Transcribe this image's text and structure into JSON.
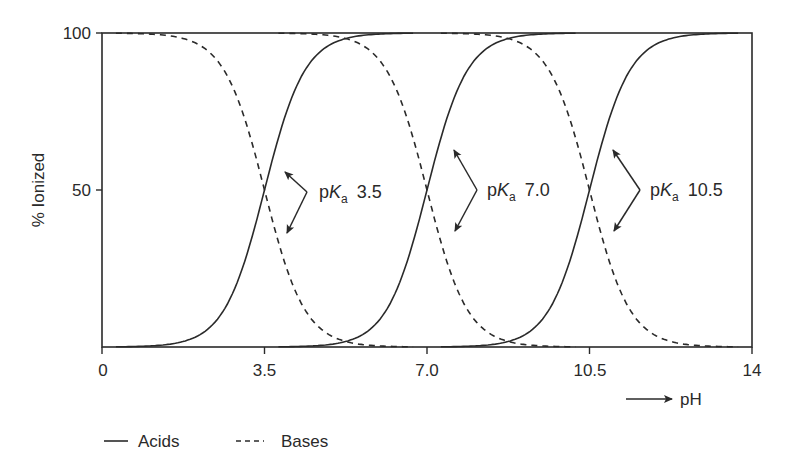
{
  "chart_data": {
    "type": "line",
    "title": "",
    "xlabel": "pH",
    "ylabel": "% Ionized",
    "xlim": [
      0,
      14
    ],
    "ylim": [
      0,
      100
    ],
    "grid": false,
    "legend_position": "bottom-left",
    "x_ticks": [
      "0",
      "3.5",
      "7.0",
      "10.5",
      "14"
    ],
    "x_tick_values": [
      0,
      3.5,
      7.0,
      10.5,
      14
    ],
    "y_ticks": [
      "50",
      "100"
    ],
    "y_tick_values": [
      50,
      100
    ],
    "legend": [
      {
        "name": "Acids",
        "style": "solid"
      },
      {
        "name": "Bases",
        "style": "dashed"
      }
    ],
    "series": [
      {
        "name": "Acid pKa 3.5",
        "group": "Acids",
        "style": "solid",
        "pKa": 3.5,
        "x": [
          1.5,
          2.0,
          2.5,
          3.0,
          3.5,
          4.0,
          4.5,
          5.0,
          5.5
        ],
        "y": [
          1,
          3,
          9,
          24,
          50,
          76,
          91,
          97,
          99
        ]
      },
      {
        "name": "Acid pKa 7.0",
        "group": "Acids",
        "style": "solid",
        "pKa": 7.0,
        "x": [
          5.0,
          5.5,
          6.0,
          6.5,
          7.0,
          7.5,
          8.0,
          8.5,
          9.0
        ],
        "y": [
          1,
          3,
          9,
          24,
          50,
          76,
          91,
          97,
          99
        ]
      },
      {
        "name": "Acid pKa 10.5",
        "group": "Acids",
        "style": "solid",
        "pKa": 10.5,
        "x": [
          8.5,
          9.0,
          9.5,
          10.0,
          10.5,
          11.0,
          11.5,
          12.0,
          12.5
        ],
        "y": [
          1,
          3,
          9,
          24,
          50,
          76,
          91,
          97,
          99
        ]
      },
      {
        "name": "Base pKa 3.5",
        "group": "Bases",
        "style": "dashed",
        "pKa": 3.5,
        "x": [
          1.5,
          2.0,
          2.5,
          3.0,
          3.5,
          4.0,
          4.5,
          5.0,
          5.5
        ],
        "y": [
          99,
          97,
          91,
          76,
          50,
          24,
          9,
          3,
          1
        ]
      },
      {
        "name": "Base pKa 7.0",
        "group": "Bases",
        "style": "dashed",
        "pKa": 7.0,
        "x": [
          5.0,
          5.5,
          6.0,
          6.5,
          7.0,
          7.5,
          8.0,
          8.5,
          9.0
        ],
        "y": [
          99,
          97,
          91,
          76,
          50,
          24,
          9,
          3,
          1
        ]
      },
      {
        "name": "Base pKa 10.5",
        "group": "Bases",
        "style": "dashed",
        "pKa": 10.5,
        "x": [
          8.5,
          9.0,
          9.5,
          10.0,
          10.5,
          11.0,
          11.5,
          12.0,
          12.5
        ],
        "y": [
          99,
          97,
          91,
          76,
          50,
          24,
          9,
          3,
          1
        ]
      }
    ],
    "annotations": [
      {
        "text_p": "p",
        "text_K": "K",
        "text_sub": "a",
        "value": "3.5",
        "at_x": 3.5,
        "at_y": 50
      },
      {
        "text_p": "p",
        "text_K": "K",
        "text_sub": "a",
        "value": "7.0",
        "at_x": 7.0,
        "at_y": 50
      },
      {
        "text_p": "p",
        "text_K": "K",
        "text_sub": "a",
        "value": "10.5",
        "at_x": 10.5,
        "at_y": 50
      }
    ]
  },
  "axes": {
    "y_label": "% Ionized",
    "x_label": "pH",
    "y_tick_100": "100",
    "y_tick_50": "50",
    "x_tick_0": "0",
    "x_tick_35": "3.5",
    "x_tick_70": "7.0",
    "x_tick_105": "10.5",
    "x_tick_14": "14"
  },
  "legend": {
    "acids": "Acids",
    "bases": "Bases"
  },
  "annotations": {
    "a1": {
      "p": "p",
      "K": "K",
      "sub": "a",
      "val": "3.5"
    },
    "a2": {
      "p": "p",
      "K": "K",
      "sub": "a",
      "val": "7.0"
    },
    "a3": {
      "p": "p",
      "K": "K",
      "sub": "a",
      "val": "10.5"
    }
  },
  "colors": {
    "ink": "#2a2a2a",
    "background": "#ffffff"
  }
}
